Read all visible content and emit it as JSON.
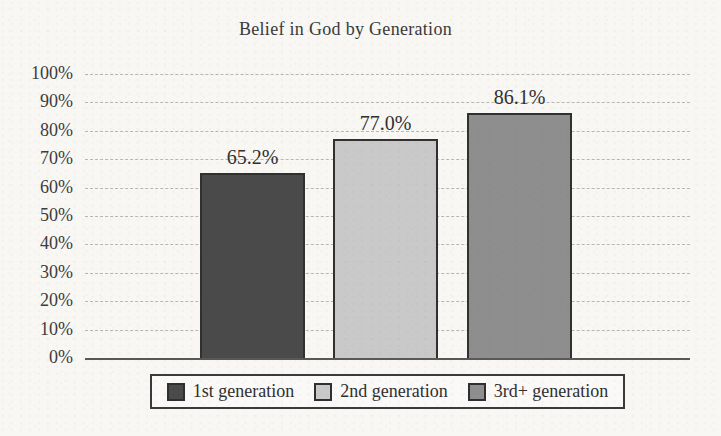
{
  "chart_data": {
    "type": "bar",
    "title": "Belief in God by Generation",
    "categories": [
      "1st generation",
      "2nd generation",
      "3rd+ generation"
    ],
    "values": [
      65.2,
      77.0,
      86.1
    ],
    "data_labels": [
      "65.2%",
      "77.0%",
      "86.1%"
    ],
    "xlabel": "",
    "ylabel": "",
    "ylim": [
      0,
      100
    ],
    "yticks": [
      {
        "value": 100,
        "label": "100%"
      },
      {
        "value": 90,
        "label": "90%"
      },
      {
        "value": 80,
        "label": "80%"
      },
      {
        "value": 70,
        "label": "70%"
      },
      {
        "value": 60,
        "label": "60%"
      },
      {
        "value": 50,
        "label": "50%"
      },
      {
        "value": 40,
        "label": "40%"
      },
      {
        "value": 30,
        "label": "30%"
      },
      {
        "value": 20,
        "label": "20%"
      },
      {
        "value": 10,
        "label": "10%"
      },
      {
        "value": 0,
        "label": "0%"
      }
    ],
    "grid": true,
    "legend_position": "bottom",
    "bar_colors": [
      "#4a4a4a",
      "#c9c9c9",
      "#8e8e8e"
    ],
    "bar_border_color": "#303030",
    "gridline_color": "#b7b6b2",
    "axis_line_color": "#585858",
    "text_color": "#3a3a3a",
    "background_color": "#f8f7f4"
  }
}
